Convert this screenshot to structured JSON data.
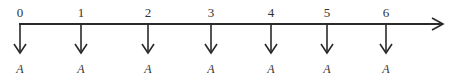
{
  "diagram": {
    "type": "cash-flow-timeline",
    "periods": [
      {
        "label": "0",
        "flow_label": "A",
        "direction": "down"
      },
      {
        "label": "1",
        "flow_label": "A",
        "direction": "down"
      },
      {
        "label": "2",
        "flow_label": "A",
        "direction": "down"
      },
      {
        "label": "3",
        "flow_label": "A",
        "direction": "down"
      },
      {
        "label": "4",
        "flow_label": "A",
        "direction": "down"
      },
      {
        "label": "5",
        "flow_label": "A",
        "direction": "down"
      },
      {
        "label": "6",
        "flow_label": "A",
        "direction": "down"
      }
    ],
    "axis_arrow": "right"
  }
}
